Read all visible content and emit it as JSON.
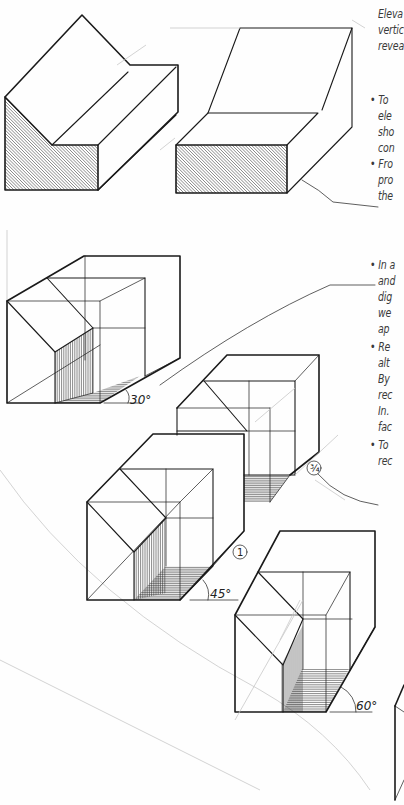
{
  "page": {
    "type": "scanned-textbook-page"
  },
  "text_column": {
    "lines": [
      {
        "text": "Eleva",
        "bullet": false
      },
      {
        "text": "vertic",
        "bullet": false
      },
      {
        "text": "revea",
        "bullet": false
      },
      {
        "text": "To",
        "bullet": true
      },
      {
        "text": "ele",
        "bullet": false
      },
      {
        "text": "sho",
        "bullet": false
      },
      {
        "text": "con",
        "bullet": false
      },
      {
        "text": "Fro",
        "bullet": true
      },
      {
        "text": "pro",
        "bullet": false
      },
      {
        "text": "the",
        "bullet": false
      },
      {
        "text": "In a",
        "bullet": true
      },
      {
        "text": "and",
        "bullet": false
      },
      {
        "text": "dig",
        "bullet": false
      },
      {
        "text": "we",
        "bullet": false
      },
      {
        "text": "ap",
        "bullet": false
      },
      {
        "text": "Re",
        "bullet": true
      },
      {
        "text": "alt",
        "bullet": false
      },
      {
        "text": "By",
        "bullet": false
      },
      {
        "text": "rec",
        "bullet": false
      },
      {
        "text": "In.",
        "bullet": false
      },
      {
        "text": "fac",
        "bullet": false
      },
      {
        "text": "To",
        "bullet": true
      },
      {
        "text": "rec",
        "bullet": false
      }
    ]
  },
  "figures": {
    "elevation_oblique_1": {
      "description": "Oblique from elevation with hatched front face, stepped roof"
    },
    "elevation_oblique_2": {
      "description": "Oblique from elevation with hatched front face, sloped top"
    },
    "cube_30": {
      "angle_label": "30°"
    },
    "cube_three_quarter": {
      "scale_marker": "¾"
    },
    "cube_45": {
      "angle_label": "45°",
      "scale_marker": "1"
    },
    "cube_60": {
      "angle_label": "60°"
    }
  }
}
